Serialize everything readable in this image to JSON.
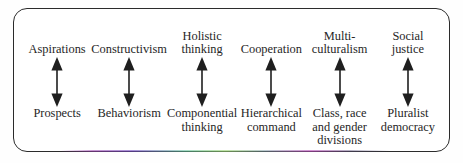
{
  "diagram": {
    "frame": {
      "shape": "rounded-rectangle",
      "border_color": "#2b2b2b",
      "background_color": "#ffffff"
    },
    "text_color": "#262626",
    "arrow": {
      "icon": "double-headed-vertical-arrow",
      "color": "#1f1f1f",
      "direction": "bidirectional"
    },
    "pairs": [
      {
        "top": "Aspirations",
        "bottom": "Prospects"
      },
      {
        "top": "Constructivism",
        "bottom": "Behaviorism"
      },
      {
        "top": "Holistic\nthinking",
        "bottom": "Componential\nthinking"
      },
      {
        "top": "Cooperation",
        "bottom": "Hierarchical\ncommand"
      },
      {
        "top": "Multi-\nculturalism",
        "bottom": "Class, race\nand gender\ndivisions"
      },
      {
        "top": "Social\njustice",
        "bottom": "Pluralist\ndemocracy"
      }
    ]
  }
}
